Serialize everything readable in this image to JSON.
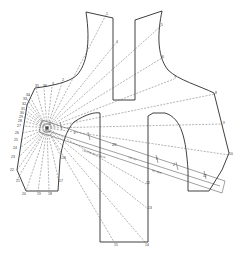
{
  "diagram": {
    "type": "pattern-grading-diagram",
    "colors": {
      "outline": "#2a2a2a",
      "dash": "#555555",
      "background": "#ffffff"
    },
    "pivot": {
      "x": 47,
      "y": 128
    },
    "point_labels": [
      {
        "id": "1",
        "x": 106,
        "y": 15
      },
      {
        "id": "4",
        "x": 116,
        "y": 43
      },
      {
        "id": "5",
        "x": 161,
        "y": 26
      },
      {
        "id": "6",
        "x": 162,
        "y": 58
      },
      {
        "id": "7",
        "x": 174,
        "y": 79
      },
      {
        "id": "8",
        "x": 215,
        "y": 94
      },
      {
        "id": "9",
        "x": 223,
        "y": 124
      },
      {
        "id": "10",
        "x": 229,
        "y": 155
      },
      {
        "id": "12",
        "x": 146,
        "y": 184
      },
      {
        "id": "13",
        "x": 148,
        "y": 209
      },
      {
        "id": "14",
        "x": 145,
        "y": 243
      },
      {
        "id": "15",
        "x": 114,
        "y": 243
      },
      {
        "id": "16",
        "x": 62,
        "y": 159
      },
      {
        "id": "17",
        "x": 59,
        "y": 182
      },
      {
        "id": "18",
        "x": 49,
        "y": 193
      },
      {
        "id": "19",
        "x": 38,
        "y": 193
      },
      {
        "id": "20",
        "x": 24,
        "y": 193
      },
      {
        "id": "21",
        "x": 17,
        "y": 182
      },
      {
        "id": "22",
        "x": 12,
        "y": 170
      },
      {
        "id": "23",
        "x": 13,
        "y": 157
      },
      {
        "id": "24",
        "x": 15,
        "y": 148
      },
      {
        "id": "25",
        "x": 16,
        "y": 140
      },
      {
        "id": "26",
        "x": 17,
        "y": 133
      },
      {
        "id": "27",
        "x": 19,
        "y": 126
      },
      {
        "id": "28",
        "x": 20,
        "y": 121
      },
      {
        "id": "29",
        "x": 21,
        "y": 117
      },
      {
        "id": "30",
        "x": 22,
        "y": 113
      },
      {
        "id": "31",
        "x": 23,
        "y": 109
      },
      {
        "id": "32",
        "x": 24,
        "y": 104
      },
      {
        "id": "33",
        "x": 25,
        "y": 99
      },
      {
        "id": "34",
        "x": 28,
        "y": 95
      },
      {
        "id": "35",
        "x": 36,
        "y": 87
      },
      {
        "id": "36",
        "x": 44,
        "y": 87
      },
      {
        "id": "2",
        "x": 62,
        "y": 81
      },
      {
        "id": "3",
        "x": 55,
        "y": 85
      }
    ],
    "ruler": {
      "labels": [
        {
          "text": "0",
          "x": 49,
          "y": 125
        },
        {
          "text": "2",
          "x": 74,
          "y": 134
        },
        {
          "text": "25",
          "x": 112,
          "y": 146
        },
        {
          "text": "CENTRE BACK NECK",
          "x": 82,
          "y": 151
        },
        {
          "text": "CH / ST",
          "x": 131,
          "y": 162
        },
        {
          "text": "1",
          "x": 156,
          "y": 160
        },
        {
          "text": "2",
          "x": 173,
          "y": 166
        },
        {
          "text": "B/L HEM",
          "x": 155,
          "y": 173
        },
        {
          "text": "12",
          "x": 203,
          "y": 177
        }
      ]
    }
  }
}
